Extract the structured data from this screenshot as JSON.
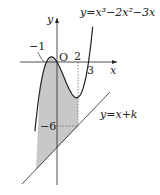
{
  "diagram": {
    "curve_label": "y=x³−2x²−3x",
    "line_label": "y=x+k",
    "axis_x_label": "x",
    "axis_y_label": "y",
    "origin_label": "O",
    "tick_labels": {
      "neg_one": "−1",
      "two": "2",
      "three": "3",
      "neg_six": "−6"
    },
    "colors": {
      "stroke": "#222222",
      "shade": "#c8c8c8"
    }
  }
}
